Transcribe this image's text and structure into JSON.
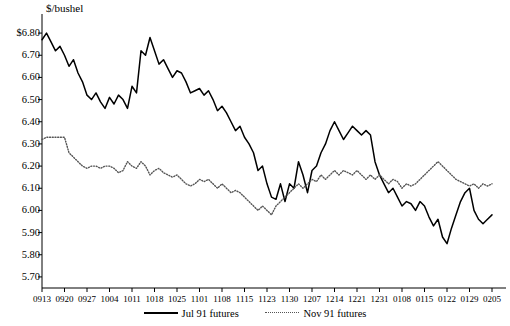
{
  "chart_data": {
    "type": "line",
    "title": "",
    "ylabel": "$/bushel",
    "xlabel": "",
    "ylim": [
      5.65,
      6.85
    ],
    "grid": false,
    "legend_position": "bottom",
    "ytick_labels": [
      "$6.80",
      "6.70",
      "6.60",
      "6.50",
      "6.40",
      "6.30",
      "6.20",
      "6.10",
      "6.00",
      "5.90",
      "5.80",
      "5.70"
    ],
    "ytick_values": [
      6.8,
      6.7,
      6.6,
      6.5,
      6.4,
      6.3,
      6.2,
      6.1,
      6.0,
      5.9,
      5.8,
      5.7
    ],
    "categories": [
      "0913",
      "0920",
      "0927",
      "1004",
      "1011",
      "1018",
      "1025",
      "1101",
      "1108",
      "1115",
      "1123",
      "1130",
      "1207",
      "1214",
      "1221",
      "1231",
      "0108",
      "0115",
      "0122",
      "0129",
      "0205"
    ],
    "xlim": [
      0,
      20
    ],
    "series": [
      {
        "name": "Jul 91 futures",
        "style": "solid",
        "color": "#000000",
        "x": [
          0,
          0.2,
          0.4,
          0.6,
          0.8,
          1.0,
          1.2,
          1.4,
          1.6,
          1.8,
          2.0,
          2.2,
          2.4,
          2.6,
          2.8,
          3.0,
          3.2,
          3.4,
          3.6,
          3.8,
          4.0,
          4.2,
          4.4,
          4.6,
          4.8,
          5.0,
          5.2,
          5.4,
          5.6,
          5.8,
          6.0,
          6.2,
          6.4,
          6.6,
          6.8,
          7.0,
          7.2,
          7.4,
          7.6,
          7.8,
          8.0,
          8.2,
          8.4,
          8.6,
          8.8,
          9.0,
          9.2,
          9.4,
          9.6,
          9.8,
          10.0,
          10.2,
          10.4,
          10.6,
          10.8,
          11.0,
          11.2,
          11.4,
          11.6,
          11.8,
          12.0,
          12.2,
          12.4,
          12.6,
          12.8,
          13.0,
          13.2,
          13.4,
          13.6,
          13.8,
          14.0,
          14.2,
          14.4,
          14.6,
          14.8,
          15.0,
          15.2,
          15.4,
          15.6,
          15.8,
          16.0,
          16.2,
          16.4,
          16.6,
          16.8,
          17.0,
          17.2,
          17.4,
          17.6,
          17.8,
          18.0,
          18.2,
          18.4,
          18.6,
          18.8,
          19.0,
          19.2,
          19.4,
          19.6,
          19.8,
          20.0
        ],
        "values": [
          6.77,
          6.8,
          6.76,
          6.72,
          6.74,
          6.7,
          6.65,
          6.68,
          6.62,
          6.58,
          6.52,
          6.5,
          6.53,
          6.49,
          6.46,
          6.51,
          6.48,
          6.52,
          6.5,
          6.46,
          6.56,
          6.53,
          6.72,
          6.7,
          6.78,
          6.72,
          6.66,
          6.68,
          6.64,
          6.6,
          6.63,
          6.62,
          6.58,
          6.53,
          6.54,
          6.55,
          6.52,
          6.54,
          6.5,
          6.45,
          6.47,
          6.44,
          6.4,
          6.36,
          6.38,
          6.33,
          6.3,
          6.26,
          6.18,
          6.2,
          6.12,
          6.06,
          6.05,
          6.12,
          6.04,
          6.12,
          6.1,
          6.22,
          6.16,
          6.08,
          6.18,
          6.2,
          6.26,
          6.3,
          6.36,
          6.4,
          6.36,
          6.32,
          6.35,
          6.38,
          6.36,
          6.34,
          6.36,
          6.34,
          6.22,
          6.16,
          6.12,
          6.08,
          6.1,
          6.06,
          6.02,
          6.04,
          6.03,
          6.0,
          6.04,
          6.02,
          5.97,
          5.93,
          5.96,
          5.88,
          5.85,
          5.92,
          5.98,
          6.04,
          6.08,
          6.1,
          6.0,
          5.96,
          5.94,
          5.96,
          5.98
        ]
      },
      {
        "name": "Nov 91 futures",
        "style": "dotted",
        "color": "#555555",
        "x": [
          0,
          0.2,
          0.4,
          0.6,
          0.8,
          1.0,
          1.2,
          1.4,
          1.6,
          1.8,
          2.0,
          2.2,
          2.4,
          2.6,
          2.8,
          3.0,
          3.2,
          3.4,
          3.6,
          3.8,
          4.0,
          4.2,
          4.4,
          4.6,
          4.8,
          5.0,
          5.2,
          5.4,
          5.6,
          5.8,
          6.0,
          6.2,
          6.4,
          6.6,
          6.8,
          7.0,
          7.2,
          7.4,
          7.6,
          7.8,
          8.0,
          8.2,
          8.4,
          8.6,
          8.8,
          9.0,
          9.2,
          9.4,
          9.6,
          9.8,
          10.0,
          10.2,
          10.4,
          10.6,
          10.8,
          11.0,
          11.2,
          11.4,
          11.6,
          11.8,
          12.0,
          12.2,
          12.4,
          12.6,
          12.8,
          13.0,
          13.2,
          13.4,
          13.6,
          13.8,
          14.0,
          14.2,
          14.4,
          14.6,
          14.8,
          15.0,
          15.2,
          15.4,
          15.6,
          15.8,
          16.0,
          16.2,
          16.4,
          16.6,
          16.8,
          17.0,
          17.2,
          17.4,
          17.6,
          17.8,
          18.0,
          18.2,
          18.4,
          18.6,
          18.8,
          19.0,
          19.2,
          19.4,
          19.6,
          19.8,
          20.0
        ],
        "values": [
          6.32,
          6.33,
          6.33,
          6.33,
          6.33,
          6.33,
          6.26,
          6.24,
          6.22,
          6.2,
          6.19,
          6.2,
          6.2,
          6.19,
          6.2,
          6.2,
          6.19,
          6.17,
          6.18,
          6.22,
          6.2,
          6.19,
          6.22,
          6.2,
          6.16,
          6.18,
          6.19,
          6.17,
          6.16,
          6.15,
          6.16,
          6.14,
          6.12,
          6.11,
          6.12,
          6.14,
          6.13,
          6.14,
          6.12,
          6.1,
          6.12,
          6.1,
          6.08,
          6.09,
          6.08,
          6.06,
          6.04,
          6.02,
          6.0,
          6.02,
          6.0,
          5.98,
          6.02,
          6.04,
          6.06,
          6.08,
          6.1,
          6.12,
          6.1,
          6.12,
          6.14,
          6.13,
          6.16,
          6.14,
          6.16,
          6.18,
          6.16,
          6.18,
          6.17,
          6.16,
          6.18,
          6.16,
          6.14,
          6.16,
          6.14,
          6.16,
          6.14,
          6.12,
          6.14,
          6.13,
          6.1,
          6.12,
          6.11,
          6.12,
          6.14,
          6.16,
          6.18,
          6.2,
          6.22,
          6.2,
          6.18,
          6.16,
          6.14,
          6.13,
          6.12,
          6.11,
          6.12,
          6.1,
          6.12,
          6.11,
          6.12
        ]
      }
    ]
  },
  "legend": {
    "items": [
      {
        "label": "Jul 91 futures",
        "style": "solid"
      },
      {
        "label": "Nov 91 futures",
        "style": "dotted"
      }
    ]
  }
}
